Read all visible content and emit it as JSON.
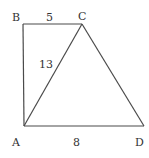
{
  "diagram": {
    "points": {
      "A": {
        "label": "A",
        "x": 24,
        "y": 126
      },
      "B": {
        "label": "B",
        "x": 23,
        "y": 24
      },
      "C": {
        "label": "C",
        "x": 82,
        "y": 24
      },
      "D": {
        "label": "D",
        "x": 144,
        "y": 126
      }
    },
    "edges": [
      {
        "from": "B",
        "to": "C"
      },
      {
        "from": "B",
        "to": "A"
      },
      {
        "from": "A",
        "to": "C"
      },
      {
        "from": "C",
        "to": "D"
      },
      {
        "from": "A",
        "to": "D"
      }
    ],
    "lengths": {
      "BC": "5",
      "AC": "13",
      "AD": "8"
    },
    "colors": {
      "stroke": "#4a4a4a",
      "text": "#333333",
      "background": "#ffffff"
    }
  }
}
